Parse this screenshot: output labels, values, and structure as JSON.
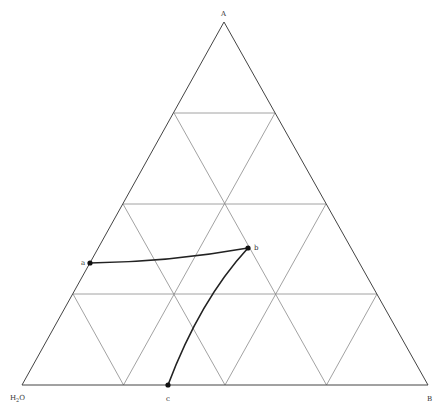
{
  "diagram": {
    "type": "ternary-phase-diagram",
    "vertices": {
      "top": {
        "label": "A"
      },
      "left": {
        "label": "H₂O",
        "label_main": "H",
        "label_sub": "2",
        "label_end": "O"
      },
      "right": {
        "label": "B"
      }
    },
    "grid_divisions": 4,
    "points": [
      {
        "id": "a",
        "label": "a"
      },
      {
        "id": "b",
        "label": "b"
      },
      {
        "id": "c",
        "label": "c"
      }
    ],
    "curves": [
      {
        "from": "a",
        "to": "b"
      },
      {
        "from": "b",
        "to": "c"
      }
    ],
    "colors": {
      "grid": "#8a8a8a",
      "edge": "#444444",
      "curve": "#222222",
      "background": "#ffffff"
    }
  }
}
